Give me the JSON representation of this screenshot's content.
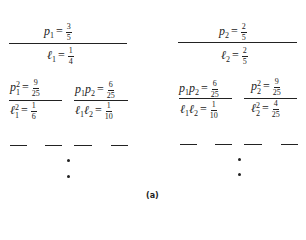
{
  "diagram": {
    "caption": "(a)",
    "left": {
      "top": {
        "p_var": "p",
        "p_sub": "1",
        "p_num": "3",
        "p_den": "5",
        "l_var": "ℓ",
        "l_sub": "1",
        "l_num": "1",
        "l_den": "4"
      },
      "children": [
        {
          "p_label": "p",
          "p_sub": "1",
          "p_sup": "2",
          "p_num": "9",
          "p_den": "25",
          "l_label": "ℓ",
          "l_sub": "1",
          "l_sup": "2",
          "l_num": "1",
          "l_den": "6"
        },
        {
          "p_label": "p",
          "p_sub": "1",
          "p_label2": "p",
          "p_sub2": "2",
          "p_num": "6",
          "p_den": "25",
          "l_label": "ℓ",
          "l_sub": "1",
          "l_label2": "ℓ",
          "l_sub2": "2",
          "l_num": "1",
          "l_den": "10"
        }
      ]
    },
    "right": {
      "top": {
        "p_var": "p",
        "p_sub": "2",
        "p_num": "2",
        "p_den": "5",
        "l_var": "ℓ",
        "l_sub": "2",
        "l_num": "2",
        "l_den": "5"
      },
      "children": [
        {
          "p_label": "p",
          "p_sub": "1",
          "p_label2": "p",
          "p_sub2": "2",
          "p_num": "6",
          "p_den": "25",
          "l_label": "ℓ",
          "l_sub": "1",
          "l_label2": "ℓ",
          "l_sub2": "2",
          "l_num": "1",
          "l_den": "10"
        },
        {
          "p_label": "p",
          "p_sub": "2",
          "p_sup": "2",
          "p_num": "9",
          "p_den": "25",
          "l_label": "ℓ",
          "l_sub": "2",
          "l_sup": "2",
          "l_num": "4",
          "l_den": "25"
        }
      ]
    },
    "equals": "="
  }
}
